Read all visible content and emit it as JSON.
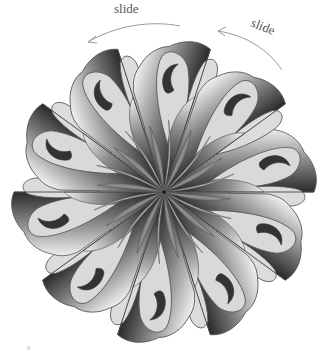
{
  "figure": {
    "type": "rosette",
    "symmetry_order": 10,
    "center": [
      164,
      192
    ],
    "outer_radius": 150,
    "colors": {
      "line": "#555555",
      "light_fill": "#d9d9d9",
      "dark_fill": "#333333",
      "gradient_dark": "#2a2a2a",
      "gradient_light": "#f2f2f2",
      "arrow": "#999999"
    }
  },
  "annotations": {
    "arrow_left_label": "slide",
    "arrow_right_label": "slide"
  },
  "footnote": "8"
}
